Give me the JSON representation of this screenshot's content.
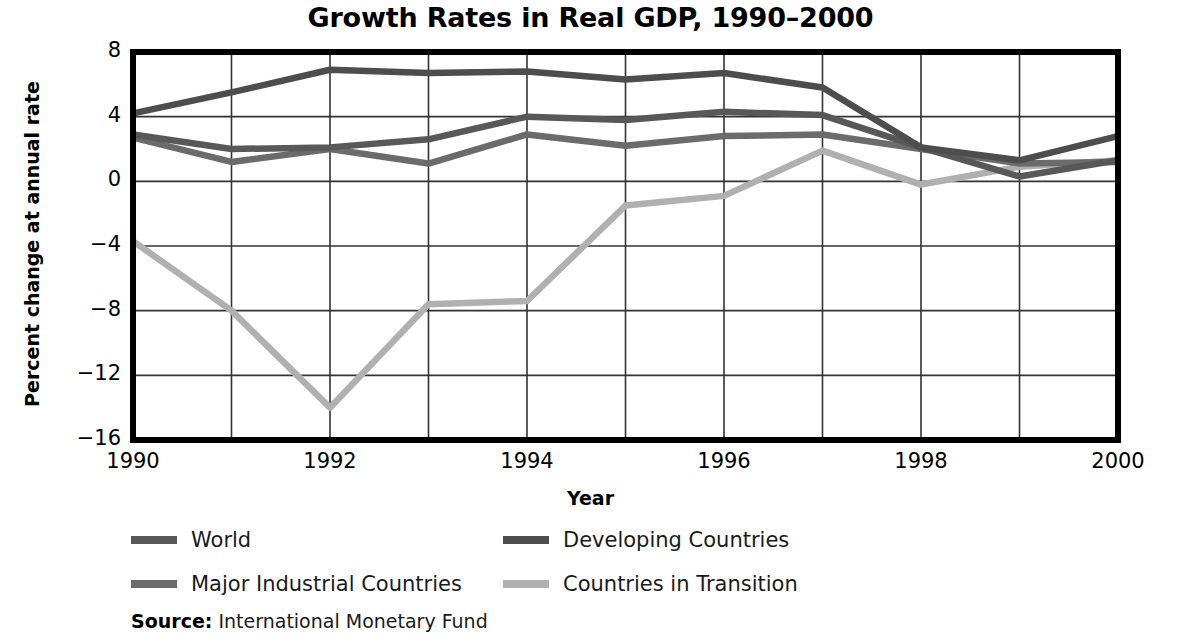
{
  "chart_data": {
    "type": "line",
    "title": "Growth Rates in Real GDP, 1990–2000",
    "xlabel": "Year",
    "ylabel": "Percent change at annual rate",
    "x": [
      1990,
      1991,
      1992,
      1993,
      1994,
      1995,
      1996,
      1997,
      1998,
      1999,
      2000
    ],
    "xtick_labels": [
      "1990",
      "1992",
      "1994",
      "1996",
      "1998",
      "2000"
    ],
    "xtick_values": [
      1990,
      1992,
      1994,
      1996,
      1998,
      2000
    ],
    "ytick_labels": [
      "8",
      "4",
      "0",
      "−4",
      "−8",
      "−12",
      "−16"
    ],
    "ytick_values": [
      8,
      4,
      0,
      -4,
      -8,
      -12,
      -16
    ],
    "xlim": [
      1990,
      2000
    ],
    "ylim": [
      -16,
      8
    ],
    "grid": true,
    "legend_position": "below-plot",
    "series": [
      {
        "name": "World",
        "color": "#585858",
        "values": [
          2.9,
          2.0,
          2.1,
          2.6,
          4.0,
          3.8,
          4.3,
          4.1,
          2.1,
          0.3,
          1.3
        ]
      },
      {
        "name": "Developing Countries",
        "color": "#4d4d4d",
        "values": [
          4.2,
          5.5,
          6.9,
          6.7,
          6.8,
          6.3,
          6.7,
          5.8,
          2.1,
          1.3,
          2.8
        ]
      },
      {
        "name": "Major Industrial Countries",
        "color": "#6b6b6b",
        "values": [
          2.7,
          1.2,
          2.0,
          1.1,
          2.9,
          2.2,
          2.8,
          2.9,
          2.0,
          1.1,
          1.2
        ]
      },
      {
        "name": "Countries in Transition",
        "color": "#b0b0b0",
        "values": [
          -3.7,
          -8.0,
          -14.0,
          -7.6,
          -7.4,
          -1.5,
          -0.9,
          1.9,
          -0.2,
          0.9,
          1.3
        ]
      }
    ],
    "source_key": "Source:",
    "source_value": "International Monetary Fund"
  }
}
